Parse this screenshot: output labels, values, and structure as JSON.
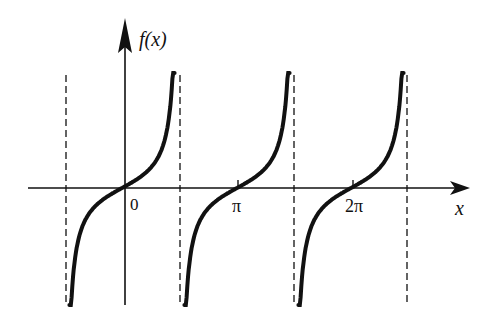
{
  "chart_data": {
    "type": "line",
    "title": "",
    "function": "tan(x)",
    "xlabel": "x",
    "ylabel": "f(x)",
    "x_ticks": [
      "0",
      "π",
      "2π"
    ],
    "asymptotes": [
      "-π/2",
      "π/2",
      "3π/2",
      "5π/2"
    ],
    "branches": [
      {
        "center": "0",
        "from": "-π/2",
        "to": "π/2"
      },
      {
        "center": "π",
        "from": "π/2",
        "to": "3π/2"
      },
      {
        "center": "2π",
        "from": "3π/2",
        "to": "5π/2"
      }
    ],
    "grid": false,
    "legend": null
  },
  "labels": {
    "y_axis": "f(x)",
    "x_axis": "x",
    "tick_0": "0",
    "tick_pi": "π",
    "tick_2pi": "2π"
  },
  "colors": {
    "curve": "#111111",
    "axis": "#111111",
    "asymptote": "#222222",
    "background": "#ffffff"
  }
}
